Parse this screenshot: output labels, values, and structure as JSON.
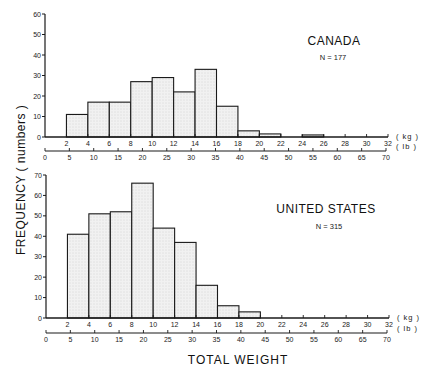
{
  "chart_data": [
    {
      "type": "bar",
      "title": "CANADA",
      "subtitle": "N = 177",
      "xlabel": "TOTAL WEIGHT",
      "ylabel": "FREQUENCY ( numbers )",
      "bin_edges_kg": [
        2,
        4,
        6,
        8,
        10,
        12,
        14,
        16,
        18,
        20,
        22,
        24,
        26
      ],
      "categories": [
        "2-4",
        "4-6",
        "6-8",
        "8-10",
        "10-12",
        "12-14",
        "14-16",
        "16-18",
        "18-20",
        "20-22",
        "22-24",
        "24-26"
      ],
      "values": [
        11,
        17,
        17,
        27,
        29,
        22,
        33,
        15,
        3,
        1.5,
        0,
        1
      ],
      "ylim": [
        0,
        60
      ],
      "yticks": [
        0,
        10,
        20,
        30,
        40,
        50,
        60
      ],
      "xticks_kg": [
        2,
        4,
        6,
        8,
        10,
        12,
        14,
        16,
        18,
        20,
        22,
        24,
        26,
        28,
        30,
        32
      ],
      "xticks_lb": [
        0,
        5,
        10,
        15,
        20,
        25,
        30,
        35,
        40,
        45,
        50,
        55,
        60,
        65,
        70
      ],
      "kg_unit": "( kg )",
      "lb_unit": "( lb )",
      "grid": false
    },
    {
      "type": "bar",
      "title": "UNITED STATES",
      "subtitle": "N = 315",
      "xlabel": "TOTAL WEIGHT",
      "ylabel": "FREQUENCY ( numbers )",
      "bin_edges_kg": [
        2,
        4,
        6,
        8,
        10,
        12,
        14,
        16,
        18,
        20
      ],
      "categories": [
        "2-4",
        "4-6",
        "6-8",
        "8-10",
        "10-12",
        "12-14",
        "14-16",
        "16-18",
        "18-20"
      ],
      "values": [
        41,
        51,
        52,
        66,
        44,
        37,
        16,
        6,
        3
      ],
      "ylim": [
        0,
        70
      ],
      "yticks": [
        0,
        10,
        20,
        30,
        40,
        50,
        60,
        70
      ],
      "xticks_kg": [
        2,
        4,
        6,
        8,
        10,
        12,
        14,
        16,
        18,
        20,
        22,
        24,
        26,
        28,
        30,
        32
      ],
      "xticks_lb": [
        0,
        5,
        10,
        15,
        20,
        25,
        30,
        35,
        40,
        45,
        50,
        55,
        60,
        65,
        70
      ],
      "kg_unit": "( kg )",
      "lb_unit": "( lb )",
      "grid": false
    }
  ],
  "labels": {
    "ylabel": "FREQUENCY ( numbers )",
    "xlabel": "TOTAL WEIGHT"
  },
  "colors": {
    "bar_fill": "#efefef",
    "bar_stroke": "#1a1a1a",
    "axis": "#1a1a1a"
  }
}
